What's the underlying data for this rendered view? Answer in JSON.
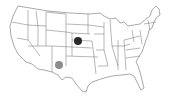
{
  "map": {
    "title": "",
    "region": "United States (contiguous)",
    "markers": [
      {
        "label": "Nebraska",
        "state": "NE",
        "color": "#2a2a2a"
      },
      {
        "label": "New Mexico",
        "state": "NM",
        "color": "#8c8c8c"
      }
    ]
  }
}
